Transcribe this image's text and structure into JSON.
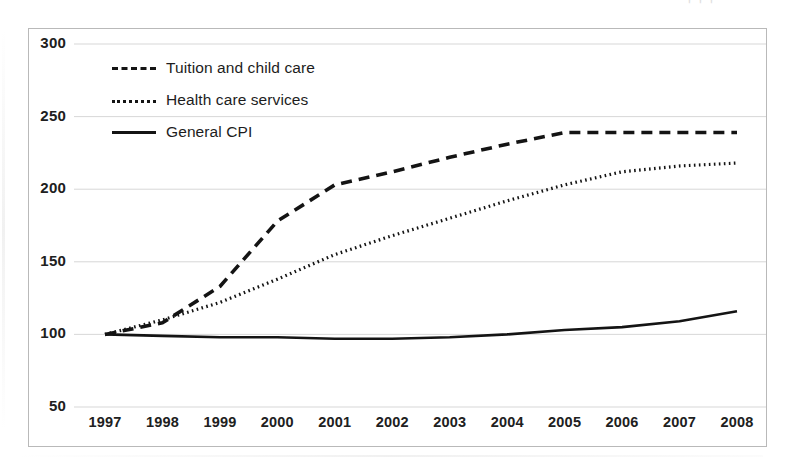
{
  "chart_data": {
    "type": "line",
    "title": "",
    "subtitle": "",
    "xlabel": "",
    "ylabel": "",
    "categories": [
      "1997",
      "1998",
      "1999",
      "2000",
      "2001",
      "2002",
      "2003",
      "2004",
      "2005",
      "2006",
      "2007",
      "2008"
    ],
    "x": [
      1997,
      1998,
      1999,
      2000,
      2001,
      2002,
      2003,
      2004,
      2005,
      2006,
      2007,
      2008
    ],
    "ylim": [
      50,
      300
    ],
    "yticks": [
      50,
      100,
      150,
      200,
      250,
      300
    ],
    "ytick_labels": [
      "50",
      "100",
      "150",
      "200",
      "250",
      "300"
    ],
    "xlim": [
      1997,
      2008
    ],
    "grid": "horizontal",
    "legend_position": "upper-left-inside",
    "series": [
      {
        "name": "Tuition and child care",
        "style": "dashed",
        "color": "#141414",
        "values": [
          100,
          108,
          133,
          178,
          203,
          212,
          222,
          231,
          239,
          239,
          239,
          239
        ]
      },
      {
        "name": "Health care services",
        "style": "dotted",
        "color": "#141414",
        "values": [
          100,
          110,
          122,
          138,
          155,
          168,
          180,
          192,
          203,
          212,
          216,
          218
        ]
      },
      {
        "name": "General CPI",
        "style": "solid",
        "color": "#141414",
        "values": [
          100,
          99,
          98,
          98,
          97,
          97,
          98,
          100,
          103,
          105,
          109,
          116
        ]
      }
    ],
    "annotations": []
  },
  "legend": {
    "items": [
      {
        "label": "Tuition and child care",
        "style": "dashed"
      },
      {
        "label": "Health care services",
        "style": "dotted"
      },
      {
        "label": "General CPI",
        "style": "solid"
      }
    ]
  },
  "artifacts": {
    "top_mark": "' ' '"
  }
}
